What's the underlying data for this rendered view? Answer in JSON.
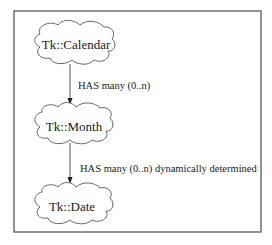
{
  "diagram": {
    "nodes": [
      {
        "id": "calendar",
        "label": "Tk::Calendar"
      },
      {
        "id": "month",
        "label": "Tk::Month"
      },
      {
        "id": "date",
        "label": "Tk::Date"
      }
    ],
    "edges": [
      {
        "from": "calendar",
        "to": "month",
        "label": "HAS many (0..n)"
      },
      {
        "from": "month",
        "to": "date",
        "label": "HAS many (0..n) dynamically determined"
      }
    ]
  }
}
